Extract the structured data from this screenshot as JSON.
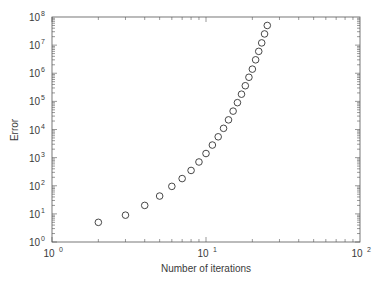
{
  "chart_data": {
    "type": "scatter",
    "title": "",
    "xlabel": "Number of iterations",
    "ylabel": "Error",
    "xscale": "log",
    "yscale": "log",
    "xlim": [
      1,
      100
    ],
    "ylim": [
      1,
      100000000
    ],
    "grid": false,
    "legend": null,
    "marker": "open-circle",
    "x_ticks": [
      {
        "base": "10",
        "exp": "0",
        "value": 1
      },
      {
        "base": "10",
        "exp": "1",
        "value": 10
      },
      {
        "base": "10",
        "exp": "2",
        "value": 100
      }
    ],
    "y_ticks": [
      {
        "base": "10",
        "exp": "0",
        "value": 1
      },
      {
        "base": "10",
        "exp": "1",
        "value": 10
      },
      {
        "base": "10",
        "exp": "2",
        "value": 100
      },
      {
        "base": "10",
        "exp": "3",
        "value": 1000
      },
      {
        "base": "10",
        "exp": "4",
        "value": 10000
      },
      {
        "base": "10",
        "exp": "5",
        "value": 100000
      },
      {
        "base": "10",
        "exp": "6",
        "value": 1000000
      },
      {
        "base": "10",
        "exp": "7",
        "value": 10000000
      },
      {
        "base": "10",
        "exp": "8",
        "value": 100000000
      }
    ],
    "series": [
      {
        "name": "Error",
        "x": [
          2,
          3,
          4,
          5,
          6,
          7,
          8,
          9,
          10,
          11,
          12,
          13,
          14,
          15,
          16,
          17,
          18,
          19,
          20,
          21,
          22,
          23,
          24,
          25
        ],
        "y": [
          5,
          9,
          20,
          43,
          95,
          180,
          350,
          700,
          1400,
          2800,
          5500,
          11000,
          22000,
          45000,
          90000,
          180000,
          360000,
          720000,
          1400000,
          3000000,
          6000000,
          12000000,
          25000000,
          50000000
        ]
      }
    ]
  },
  "colors": {
    "axis": "#555555",
    "marker": "#333333",
    "text": "#3a3a3a"
  }
}
